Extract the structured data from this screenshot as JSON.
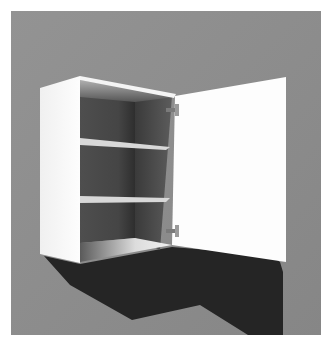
{
  "image": {
    "subject": "Wall cabinet with open door",
    "description": "3D render of a white wall-mounted cabinet with two adjustable shelves and a single door swung open to the right, casting a shadow on a gray wall",
    "shelf_count": 2,
    "hinge_count": 2
  },
  "colors": {
    "page_background": "#ffffff",
    "wall": "#8f8f8f",
    "cabinet_white": "#fafafa",
    "interior_dark": "#3c3c3c",
    "interior_mid": "#5a5a5a",
    "shadow": "#262626",
    "hinge": "#8a8a8a"
  }
}
